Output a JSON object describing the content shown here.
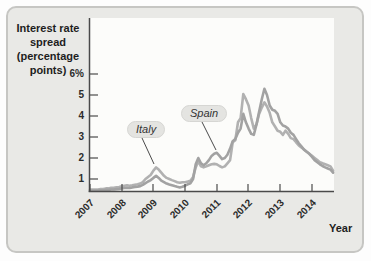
{
  "figure": {
    "title_lines": [
      "Interest rate",
      "spread",
      "(percentage",
      "points)"
    ],
    "title_full": "Interest rate spread (percentage points)",
    "x_axis_title": "Year"
  },
  "colors": {
    "card_background": "#e9e9e6",
    "plot_background": "#fcfcfa",
    "axis": "#4a4a4a",
    "italy_line": "#b1b1b1",
    "spain_line": "#a2a2a2",
    "annotation_badge": "#e4e4e1"
  },
  "chart_data": {
    "type": "line",
    "title": "Interest rate spread (percentage points)",
    "xlabel": "Year",
    "ylabel": "Interest rate spread (percentage points)",
    "x_tick_labels": [
      "2007",
      "2008",
      "2009",
      "2010",
      "2011",
      "2012",
      "2013",
      "2014"
    ],
    "y_tick_labels": [
      "6%",
      "5",
      "4",
      "3",
      "2",
      "1"
    ],
    "y_tick_values": [
      6,
      5,
      4,
      3,
      2,
      1
    ],
    "y_axis_unit": "percentage points",
    "x_range": [
      2007.0,
      2014.75
    ],
    "grid": false,
    "legend_position": "inline-callouts",
    "annotations": [
      {
        "text": "Italy",
        "points_to": {
          "x": 2009.1,
          "y": 1.55
        }
      },
      {
        "text": "Spain",
        "points_to": {
          "x": 2011.0,
          "y": 2.25
        }
      }
    ],
    "x_start_year": 2007,
    "points_per_year": 12,
    "series": [
      {
        "name": "Italy",
        "color": "#b1b1b1",
        "values": [
          0.5,
          0.5,
          0.5,
          0.5,
          0.52,
          0.52,
          0.55,
          0.55,
          0.58,
          0.58,
          0.6,
          0.62,
          0.65,
          0.68,
          0.7,
          0.68,
          0.7,
          0.73,
          0.75,
          0.78,
          0.85,
          1.0,
          1.1,
          1.2,
          1.4,
          1.55,
          1.45,
          1.3,
          1.15,
          1.05,
          1.0,
          0.95,
          0.9,
          0.85,
          0.82,
          0.85,
          0.85,
          0.88,
          0.92,
          1.1,
          1.55,
          1.85,
          1.6,
          1.55,
          1.6,
          1.65,
          1.7,
          1.72,
          1.7,
          1.62,
          1.55,
          1.6,
          1.75,
          1.9,
          2.75,
          2.85,
          3.7,
          3.9,
          5.05,
          4.8,
          4.5,
          3.9,
          3.4,
          3.6,
          4.1,
          4.4,
          4.65,
          4.45,
          4.15,
          3.7,
          3.5,
          3.3,
          3.25,
          3.1,
          3.3,
          3.15,
          2.95,
          2.9,
          2.75,
          2.6,
          2.5,
          2.4,
          2.3,
          2.2,
          2.1,
          2.0,
          1.9,
          1.8,
          1.75,
          1.7,
          1.65,
          1.6,
          1.4
        ]
      },
      {
        "name": "Spain",
        "color": "#a2a2a2",
        "values": [
          0.45,
          0.45,
          0.45,
          0.45,
          0.46,
          0.46,
          0.48,
          0.48,
          0.5,
          0.5,
          0.52,
          0.53,
          0.55,
          0.57,
          0.58,
          0.57,
          0.6,
          0.62,
          0.64,
          0.66,
          0.72,
          0.8,
          0.88,
          0.95,
          1.05,
          1.15,
          1.05,
          0.92,
          0.85,
          0.78,
          0.74,
          0.7,
          0.66,
          0.63,
          0.6,
          0.63,
          0.68,
          0.75,
          0.8,
          1.0,
          1.7,
          2.0,
          1.75,
          1.65,
          1.75,
          1.9,
          2.1,
          2.2,
          2.25,
          2.1,
          1.95,
          2.0,
          2.15,
          2.45,
          2.8,
          2.9,
          3.2,
          3.4,
          4.1,
          3.7,
          3.4,
          3.15,
          3.1,
          3.6,
          4.2,
          4.8,
          5.3,
          5.0,
          4.5,
          4.3,
          4.25,
          4.1,
          3.7,
          3.55,
          3.5,
          3.4,
          3.2,
          3.1,
          2.9,
          2.7,
          2.55,
          2.4,
          2.3,
          2.2,
          2.05,
          1.9,
          1.8,
          1.7,
          1.62,
          1.55,
          1.5,
          1.45,
          1.3
        ]
      }
    ]
  }
}
